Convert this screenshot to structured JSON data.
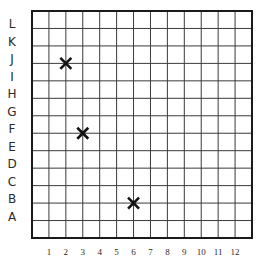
{
  "grid": {
    "columns": 13,
    "rows": 13,
    "line_color": "#3a3a3a",
    "border_color": "#1a1a1a",
    "mark_color": "#111111"
  },
  "axes": {
    "x_labels": [
      "1",
      "2",
      "3",
      "4",
      "5",
      "6",
      "7",
      "8",
      "9",
      "10",
      "11",
      "12"
    ],
    "y_labels": [
      "L",
      "K",
      "J",
      "I",
      "H",
      "G",
      "F",
      "E",
      "D",
      "C",
      "B",
      "A"
    ]
  },
  "marks": [
    {
      "symbol": "X",
      "x": 2,
      "y": "J"
    },
    {
      "symbol": "X",
      "x": 3,
      "y": "F"
    },
    {
      "symbol": "X",
      "x": 6,
      "y": "B"
    }
  ]
}
